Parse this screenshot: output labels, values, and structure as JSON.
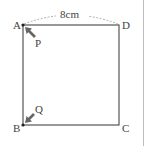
{
  "diagram": {
    "type": "geometry-square",
    "vertices": {
      "A": {
        "label": "A",
        "x": 23,
        "y": 25
      },
      "D": {
        "label": "D",
        "x": 119,
        "y": 25
      },
      "B": {
        "label": "B",
        "x": 23,
        "y": 125
      },
      "C": {
        "label": "C",
        "x": 119,
        "y": 125
      }
    },
    "dimension": {
      "label": "8cm",
      "from": "A",
      "to": "D",
      "style": "dashed-arc"
    },
    "movers": [
      {
        "label": "P",
        "at": "A",
        "direction": "toward A (up-left)"
      },
      {
        "label": "Q",
        "at": "B",
        "direction": "toward B (down-left)"
      }
    ],
    "colors": {
      "line": "#555555",
      "dashed": "#999999",
      "arrow": "#666666",
      "text": "#444444",
      "right_rule": "#bdbdbd"
    }
  }
}
